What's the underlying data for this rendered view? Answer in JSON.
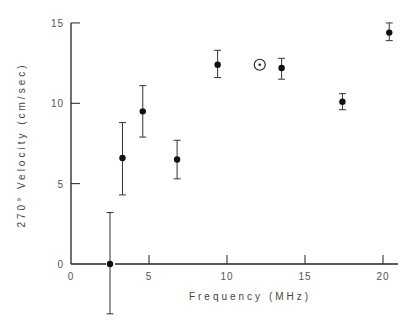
{
  "chart_data": {
    "type": "scatter",
    "title": "",
    "xlabel": "Frequency (MHz)",
    "ylabel": "270° Velocity (cm/sec)",
    "xlim": [
      0,
      21
    ],
    "ylim": [
      -3.2,
      15
    ],
    "xticks": [
      0,
      5,
      10,
      15,
      20
    ],
    "yticks": [
      0,
      5,
      10,
      15
    ],
    "grid": false,
    "legend": null,
    "series": [
      {
        "name": "measurements",
        "marker": "filled-circle",
        "points": [
          {
            "x": 2.5,
            "y": 0.0,
            "err_high": 3.2,
            "err_low": -3.1
          },
          {
            "x": 3.3,
            "y": 6.6,
            "err_high": 8.8,
            "err_low": 4.3
          },
          {
            "x": 4.6,
            "y": 9.5,
            "err_high": 11.1,
            "err_low": 7.9
          },
          {
            "x": 6.8,
            "y": 6.5,
            "err_high": 7.7,
            "err_low": 5.3
          },
          {
            "x": 9.4,
            "y": 12.4,
            "err_high": 13.3,
            "err_low": 11.6
          },
          {
            "x": 13.5,
            "y": 12.2,
            "err_high": 12.8,
            "err_low": 11.5
          },
          {
            "x": 17.4,
            "y": 10.1,
            "err_high": 10.6,
            "err_low": 9.6
          },
          {
            "x": 20.4,
            "y": 14.4,
            "err_high": 15.0,
            "err_low": 13.9
          }
        ]
      },
      {
        "name": "special point",
        "marker": "circled-dot",
        "points": [
          {
            "x": 12.1,
            "y": 12.4
          }
        ]
      }
    ]
  },
  "labels": {
    "x_axis": "Frequency (MHz)",
    "y_axis": "270° Velocity (cm/sec)",
    "y_origin": "0",
    "x_origin": "0"
  }
}
